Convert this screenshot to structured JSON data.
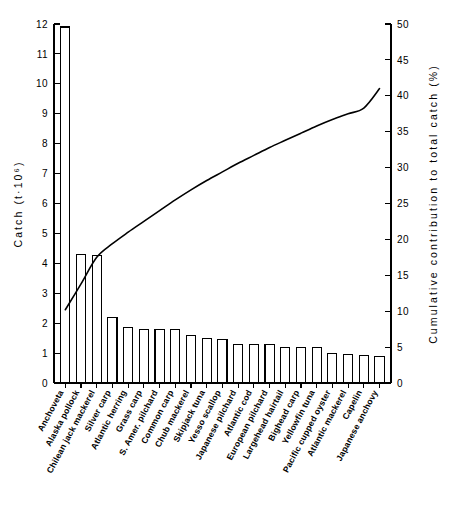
{
  "chart_data": {
    "type": "bar",
    "title": "",
    "subtitle": "",
    "xlabel": "",
    "ylabel": "Catch  (t·10⁶)",
    "y2label": "Cumulative contribution to total catch (%)",
    "ylim": [
      0,
      12
    ],
    "y2lim": [
      0,
      50
    ],
    "ytick_labels": [
      "0",
      "1",
      "2",
      "3",
      "4",
      "5",
      "6",
      "7",
      "8",
      "9",
      "10",
      "11",
      "12"
    ],
    "yticks": [
      0,
      1,
      2,
      3,
      4,
      5,
      6,
      7,
      8,
      9,
      10,
      11,
      12
    ],
    "y2tick_labels": [
      "0",
      "5",
      "10",
      "15",
      "20",
      "25",
      "30",
      "35",
      "40",
      "45",
      "50"
    ],
    "y2ticks": [
      0,
      5,
      10,
      15,
      20,
      25,
      30,
      35,
      40,
      45,
      50
    ],
    "grid": false,
    "legend": "none",
    "categories": [
      "Anchoveta",
      "Alaska pollock",
      "Chilean jack mackerel",
      "Silver carp",
      "Atlantic herring",
      "Grass carp",
      "S. Amer. pilchard",
      "Common carp",
      "Chub mackerel",
      "Skipjack tuna",
      "Yesso scallop",
      "Japanese pilchard",
      "Atlantic cod",
      "European pilchard",
      "Largehead hairtail",
      "Bighead carp",
      "Yellowfin tuna",
      "Pacific cupped oyster",
      "Atlantic mackerel",
      "Capelin",
      "Japanese anchovy"
    ],
    "series": [
      {
        "name": "Catch",
        "axis": "left",
        "units": "t·10⁶",
        "values": [
          11.9,
          4.3,
          4.25,
          2.2,
          1.85,
          1.8,
          1.78,
          1.78,
          1.6,
          1.5,
          1.45,
          1.3,
          1.3,
          1.3,
          1.2,
          1.2,
          1.2,
          1.0,
          0.95,
          0.92,
          0.88
        ]
      },
      {
        "name": "Cumulative contribution to total catch",
        "axis": "right",
        "type": "line",
        "units": "%",
        "values": [
          10.2,
          13.8,
          17.5,
          19.4,
          21.0,
          22.5,
          24.0,
          25.5,
          26.9,
          28.2,
          29.4,
          30.6,
          31.7,
          32.8,
          33.8,
          34.8,
          35.8,
          36.7,
          37.5,
          38.3,
          41.0
        ]
      }
    ]
  },
  "axes": {
    "left_title": "Catch  (t·10⁶)",
    "right_title": "Cumulative contribution to total catch (%)"
  }
}
